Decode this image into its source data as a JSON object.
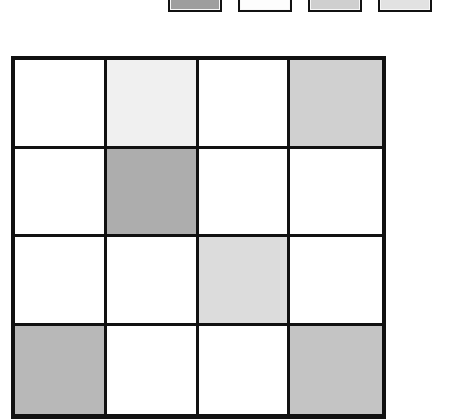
{
  "figure": {
    "type": "shaded-grid",
    "rows": 4,
    "columns": 4,
    "grid_border_color": "#111111",
    "background_color": "#ffffff",
    "empty_cell_color": "#ffffff"
  },
  "legend": {
    "name": "legend-strip",
    "clipped_top": true,
    "swatches": [
      {
        "id": "legend-swatch-1",
        "fill": "#9e9e9e",
        "border": "#111111",
        "left": 168
      },
      {
        "id": "legend-swatch-2",
        "fill": "#fdfdfd",
        "border": "#111111",
        "left": 238
      },
      {
        "id": "legend-swatch-3",
        "fill": "#cfcfcf",
        "border": "#111111",
        "left": 308
      },
      {
        "id": "legend-swatch-4",
        "fill": "#e2e2e2",
        "border": "#111111",
        "left": 378
      }
    ]
  },
  "grid": {
    "cells": [
      [
        {
          "id": "cell-r1c1",
          "fill": "#ffffff",
          "shaded": false
        },
        {
          "id": "cell-r1c2",
          "fill": "#f0f0f0",
          "shaded": true
        },
        {
          "id": "cell-r1c3",
          "fill": "#ffffff",
          "shaded": false
        },
        {
          "id": "cell-r1c4",
          "fill": "#d0d0d0",
          "shaded": true
        }
      ],
      [
        {
          "id": "cell-r2c1",
          "fill": "#ffffff",
          "shaded": false
        },
        {
          "id": "cell-r2c2",
          "fill": "#adadad",
          "shaded": true
        },
        {
          "id": "cell-r2c3",
          "fill": "#ffffff",
          "shaded": false
        },
        {
          "id": "cell-r2c4",
          "fill": "#ffffff",
          "shaded": false
        }
      ],
      [
        {
          "id": "cell-r3c1",
          "fill": "#ffffff",
          "shaded": false
        },
        {
          "id": "cell-r3c2",
          "fill": "#ffffff",
          "shaded": false
        },
        {
          "id": "cell-r3c3",
          "fill": "#dcdcdc",
          "shaded": true
        },
        {
          "id": "cell-r3c4",
          "fill": "#ffffff",
          "shaded": false
        }
      ],
      [
        {
          "id": "cell-r4c1",
          "fill": "#b8b8b8",
          "shaded": true
        },
        {
          "id": "cell-r4c2",
          "fill": "#ffffff",
          "shaded": false
        },
        {
          "id": "cell-r4c3",
          "fill": "#ffffff",
          "shaded": false
        },
        {
          "id": "cell-r4c4",
          "fill": "#c4c4c4",
          "shaded": true
        }
      ]
    ]
  }
}
